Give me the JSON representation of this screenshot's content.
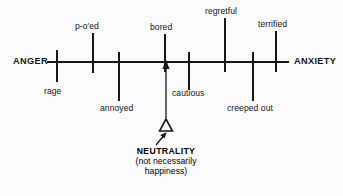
{
  "figure": {
    "type": "annotated-number-line",
    "background_color": "#fbfbfc",
    "ink_color": "#15161a"
  },
  "axis": {
    "left_pole_label": "ANGER",
    "right_pole_label": "ANXIETY",
    "line_y": 62,
    "line_x_start": 47,
    "line_x_end": 289
  },
  "ticks": [
    {
      "id": "rage",
      "label": "rage",
      "x": 57,
      "side": "below"
    },
    {
      "id": "poed",
      "label": "p-o'ed",
      "x": 93,
      "side": "above"
    },
    {
      "id": "annoyed",
      "label": "annoyed",
      "x": 119,
      "side": "below"
    },
    {
      "id": "bored",
      "label": "bored",
      "x": 165,
      "side": "above"
    },
    {
      "id": "cautious",
      "label": "cautious",
      "x": 189,
      "side": "below"
    },
    {
      "id": "regretful",
      "label": "regretful",
      "x": 225,
      "side": "above"
    },
    {
      "id": "creeped-out",
      "label": "creeped out",
      "x": 253,
      "side": "below"
    },
    {
      "id": "terrified",
      "label": "terrified",
      "x": 276,
      "side": "above"
    }
  ],
  "marker": {
    "glyph": "triangle-outline",
    "x": 166,
    "y": 127,
    "pointer_to_axis": true,
    "callout_arrow": "diagonal-up-right"
  },
  "note": {
    "line1": "NEUTRALITY",
    "line2": "(not necessarily",
    "line3": "happiness)"
  }
}
